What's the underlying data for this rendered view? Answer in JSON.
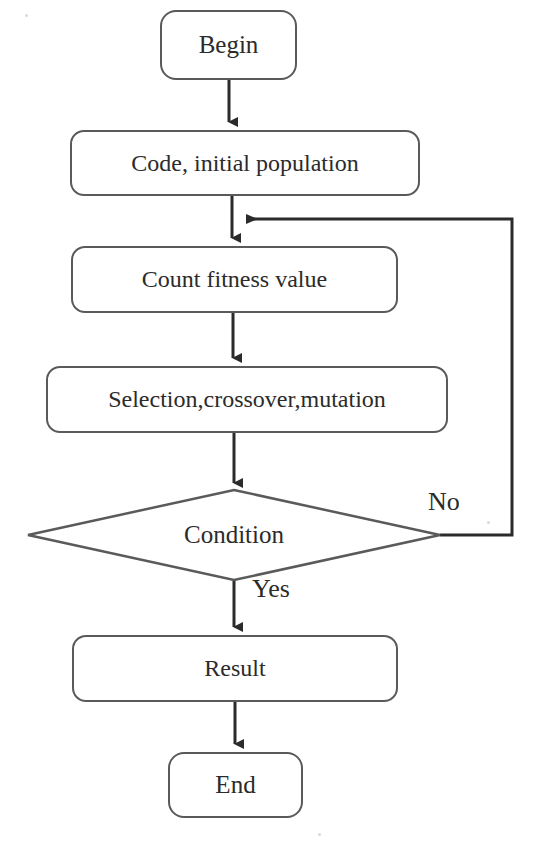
{
  "diagram": {
    "stroke_color": "#5a5a5a",
    "text_color": "#2b2b2b",
    "background_color": "#ffffff",
    "nodes": [
      {
        "id": "begin",
        "label": "Begin",
        "shape": "terminator",
        "x": 160,
        "y": 10,
        "w": 137,
        "h": 70,
        "font_size": 25
      },
      {
        "id": "code",
        "label": "Code, initial population",
        "shape": "process",
        "x": 70,
        "y": 130,
        "w": 350,
        "h": 66,
        "font_size": 24
      },
      {
        "id": "fitness",
        "label": "Count fitness value",
        "shape": "process",
        "x": 71,
        "y": 246,
        "w": 327,
        "h": 67,
        "font_size": 24
      },
      {
        "id": "operators",
        "label": "Selection,crossover,mutation",
        "shape": "process",
        "x": 46,
        "y": 366,
        "w": 402,
        "h": 67,
        "font_size": 24
      },
      {
        "id": "condition",
        "label": "Condition",
        "shape": "decision",
        "x": 28,
        "y": 490,
        "w": 412,
        "h": 90,
        "font_size": 25
      },
      {
        "id": "result",
        "label": "Result",
        "shape": "process",
        "x": 72,
        "y": 635,
        "w": 326,
        "h": 67,
        "font_size": 24
      },
      {
        "id": "end",
        "label": "End",
        "shape": "terminator",
        "x": 168,
        "y": 752,
        "w": 135,
        "h": 66,
        "font_size": 25
      }
    ],
    "edge_labels": [
      {
        "id": "no",
        "text": "No",
        "x": 428,
        "y": 487,
        "font_size": 26
      },
      {
        "id": "yes",
        "text": "Yes",
        "x": 252,
        "y": 574,
        "font_size": 26
      }
    ],
    "connectors": [
      {
        "id": "begin-to-code",
        "from": "begin",
        "to": "code",
        "type": "vertical-arrow"
      },
      {
        "id": "code-to-fitness",
        "from": "code",
        "to": "fitness",
        "type": "vertical-arrow"
      },
      {
        "id": "fitness-to-operators",
        "from": "fitness",
        "to": "operators",
        "type": "vertical-arrow"
      },
      {
        "id": "operators-to-condition",
        "from": "operators",
        "to": "condition",
        "type": "vertical-arrow"
      },
      {
        "id": "condition-yes-result",
        "from": "condition",
        "to": "result",
        "type": "vertical-arrow",
        "label": "Yes"
      },
      {
        "id": "result-to-end",
        "from": "result",
        "to": "end",
        "type": "vertical-arrow"
      },
      {
        "id": "condition-no-feedback",
        "from": "condition",
        "to": "fitness",
        "type": "feedback-loop",
        "label": "No"
      }
    ]
  }
}
